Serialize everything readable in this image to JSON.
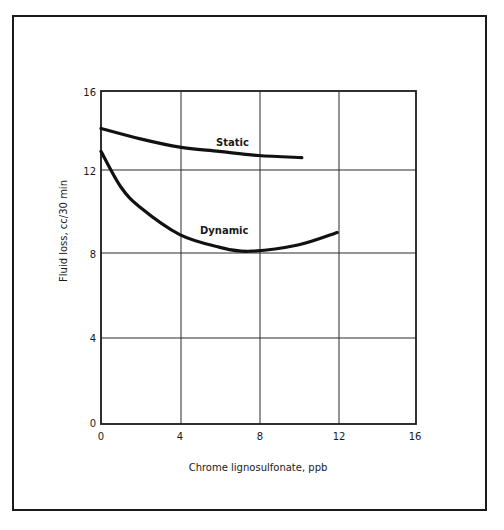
{
  "chart_data": {
    "type": "line",
    "title": "",
    "xlabel": "Chrome lignosulfonate, ppb",
    "ylabel": "Fluid loss, cc/30 min",
    "xlim": [
      0,
      16
    ],
    "ylim": [
      0,
      16
    ],
    "xticks": [
      0,
      4,
      8,
      12,
      16
    ],
    "yticks": [
      0,
      4,
      8,
      12,
      16
    ],
    "grid": true,
    "legend": "inline labels",
    "series": [
      {
        "name": "Static",
        "x": [
          0,
          2,
          4,
          6,
          8,
          10.2
        ],
        "y": [
          14.2,
          13.7,
          13.3,
          13.1,
          12.9,
          12.8
        ]
      },
      {
        "name": "Dynamic",
        "x": [
          0,
          1,
          2,
          4,
          6,
          7.5,
          10,
          12
        ],
        "y": [
          13.1,
          11.4,
          10.4,
          9.1,
          8.5,
          8.3,
          8.6,
          9.2
        ]
      }
    ]
  },
  "labels": {
    "x_axis": "Chrome lignosulfonate, ppb",
    "y_axis": "Fluid loss, cc/30 min",
    "series_static": "Static",
    "series_dynamic": "Dynamic",
    "xticks": [
      "0",
      "4",
      "8",
      "12",
      "16"
    ],
    "yticks": [
      "0",
      "4",
      "8",
      "12",
      "16"
    ]
  }
}
